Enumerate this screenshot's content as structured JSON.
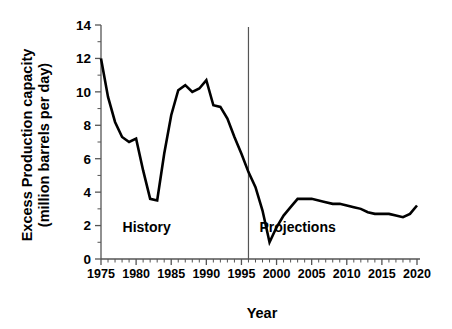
{
  "chart_data": {
    "type": "line",
    "title": "",
    "xlabel": "Year",
    "ylabel": "Excess Production capacity (million barrels per day)",
    "ylabel_line1": "Excess Production capacity",
    "ylabel_line2": "(million barrels per day)",
    "xlim": [
      1975,
      2020
    ],
    "ylim": [
      0,
      14
    ],
    "grid": false,
    "legend": "none",
    "y_ticks": [
      0,
      2,
      4,
      6,
      8,
      10,
      12,
      14
    ],
    "y_tick_labels": [
      "0",
      "2",
      "4",
      "6",
      "8",
      "10",
      "12",
      "14"
    ],
    "y_minor_tick_step": 1,
    "x_ticks": [
      1975,
      1980,
      1985,
      1990,
      1995,
      2000,
      2005,
      2010,
      2015,
      2020
    ],
    "x_tick_labels": [
      "1975",
      "1980",
      "1985",
      "1990",
      "1995",
      "2000",
      "2005",
      "2010",
      "2015",
      "2020"
    ],
    "x_minor_tick_step": 1,
    "series": [
      {
        "name": "Excess production capacity",
        "x": [
          1975,
          1976,
          1977,
          1978,
          1979,
          1980,
          1981,
          1982,
          1983,
          1984,
          1985,
          1986,
          1987,
          1988,
          1989,
          1990,
          1991,
          1992,
          1993,
          1994,
          1995,
          1996,
          1997,
          1998,
          1999,
          2000,
          2001,
          2002,
          2003,
          2004,
          2005,
          2006,
          2007,
          2008,
          2009,
          2010,
          2011,
          2012,
          2013,
          2014,
          2015,
          2016,
          2017,
          2018,
          2019,
          2020
        ],
        "values": [
          12.0,
          9.7,
          8.2,
          7.3,
          7.0,
          7.2,
          5.3,
          3.6,
          3.5,
          6.3,
          8.6,
          10.1,
          10.4,
          10.0,
          10.2,
          10.7,
          9.2,
          9.1,
          8.4,
          7.3,
          6.3,
          5.2,
          4.3,
          2.9,
          1.0,
          1.9,
          2.6,
          3.1,
          3.6,
          3.6,
          3.6,
          3.5,
          3.4,
          3.3,
          3.3,
          3.2,
          3.1,
          3.0,
          2.8,
          2.7,
          2.7,
          2.7,
          2.6,
          2.5,
          2.7,
          3.2
        ]
      }
    ],
    "annotations": [
      {
        "text": "History",
        "x": 1981.5,
        "y": 1.6
      },
      {
        "text": "Projections",
        "x": 2003.0,
        "y": 1.6
      }
    ],
    "divider": {
      "x": 1996,
      "label": "history-projection-divider"
    }
  },
  "colors": {
    "line": "#000000",
    "axis": "#555555",
    "background": "#ffffff",
    "text": "#000000"
  }
}
